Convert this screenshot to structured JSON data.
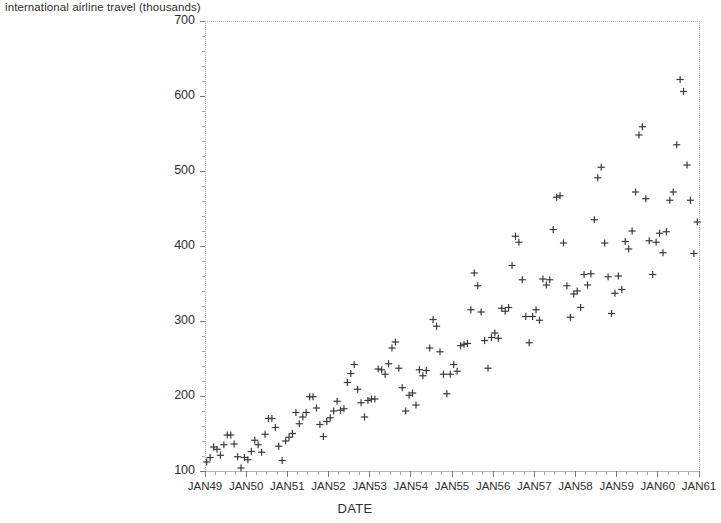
{
  "chart_data": {
    "type": "scatter",
    "title": "international airline travel (thousands)",
    "xlabel": "DATE",
    "ylabel": "",
    "marker": "plus",
    "marker_color": "#3a3a3a",
    "frame_color": "#b8b8b8",
    "background": "#ffffff",
    "grid": false,
    "legend": null,
    "xlim": [
      "JAN49",
      "JAN61"
    ],
    "ylim": [
      100,
      700
    ],
    "ytick_labels": [
      "700",
      "600",
      "500",
      "400",
      "300",
      "200",
      "100"
    ],
    "ytick_values": [
      700,
      600,
      500,
      400,
      300,
      200,
      100
    ],
    "y_minor_interval": 20,
    "xtick_labels": [
      "JAN49",
      "JAN50",
      "JAN51",
      "JAN52",
      "JAN53",
      "JAN54",
      "JAN55",
      "JAN56",
      "JAN57",
      "JAN58",
      "JAN59",
      "JAN60",
      "JAN61"
    ],
    "xtick_values": [
      1949,
      1950,
      1951,
      1952,
      1953,
      1954,
      1955,
      1956,
      1957,
      1958,
      1959,
      1960,
      1961
    ],
    "x_minor_per_major": 4,
    "x_unit": "month",
    "x_start": "JAN49",
    "n_points": 144,
    "series": [
      {
        "name": "international airline travel (thousands)",
        "values": [
          112,
          118,
          132,
          129,
          121,
          135,
          148,
          148,
          136,
          119,
          104,
          118,
          115,
          126,
          141,
          135,
          125,
          149,
          170,
          170,
          158,
          133,
          114,
          140,
          145,
          150,
          178,
          163,
          172,
          178,
          199,
          199,
          184,
          162,
          146,
          166,
          171,
          180,
          193,
          181,
          183,
          218,
          230,
          242,
          209,
          191,
          172,
          194,
          196,
          196,
          236,
          235,
          229,
          243,
          264,
          272,
          237,
          211,
          180,
          201,
          204,
          188,
          235,
          227,
          234,
          264,
          302,
          293,
          259,
          229,
          203,
          229,
          242,
          233,
          267,
          269,
          270,
          315,
          364,
          347,
          312,
          274,
          237,
          278,
          284,
          277,
          317,
          313,
          318,
          374,
          413,
          405,
          355,
          306,
          271,
          306,
          315,
          301,
          356,
          348,
          355,
          422,
          465,
          467,
          404,
          347,
          305,
          336,
          340,
          318,
          362,
          348,
          363,
          435,
          491,
          505,
          404,
          359,
          310,
          337,
          360,
          342,
          406,
          396,
          420,
          472,
          548,
          559,
          463,
          407,
          362,
          405,
          417,
          391,
          419,
          461,
          472,
          535,
          622,
          606,
          508,
          461,
          390,
          432
        ]
      }
    ]
  }
}
